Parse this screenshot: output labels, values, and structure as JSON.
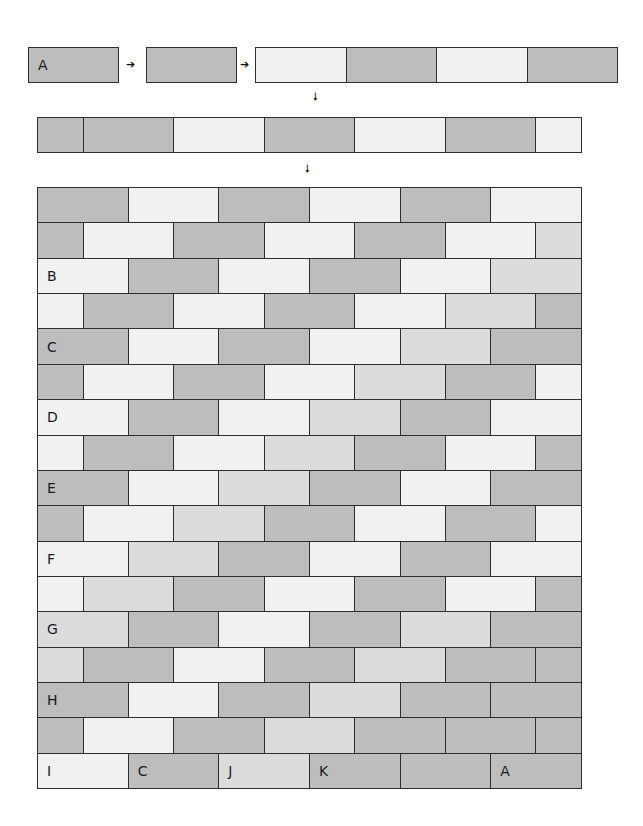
{
  "colors": {
    "D": "#bdbdbd",
    "M": "#dcdcdc",
    "L": "#f1f1f1",
    "border": "#2e2e2e"
  },
  "step1": {
    "box_a": {
      "label": "A",
      "color": "D"
    },
    "box_b": {
      "label": "",
      "color": "D"
    },
    "strip": [
      "L",
      "D",
      "L",
      "D"
    ]
  },
  "arrows": {
    "right": "➔",
    "down": "🠗"
  },
  "step2": {
    "cells": [
      {
        "w": 0.5,
        "c": "D"
      },
      {
        "w": 1,
        "c": "D"
      },
      {
        "w": 1,
        "c": "L"
      },
      {
        "w": 1,
        "c": "D"
      },
      {
        "w": 1,
        "c": "L"
      },
      {
        "w": 1,
        "c": "D"
      },
      {
        "w": 0.5,
        "c": "L"
      }
    ]
  },
  "wall": {
    "rows": [
      {
        "offset": false,
        "cells": [
          {
            "c": "D",
            "label": ""
          },
          {
            "c": "L",
            "label": ""
          },
          {
            "c": "D",
            "label": ""
          },
          {
            "c": "L",
            "label": ""
          },
          {
            "c": "D",
            "label": ""
          },
          {
            "c": "L",
            "label": ""
          }
        ]
      },
      {
        "offset": true,
        "cells": [
          {
            "c": "D",
            "label": ""
          },
          {
            "c": "L",
            "label": ""
          },
          {
            "c": "D",
            "label": ""
          },
          {
            "c": "L",
            "label": ""
          },
          {
            "c": "D",
            "label": ""
          },
          {
            "c": "L",
            "label": ""
          },
          {
            "c": "M",
            "label": ""
          }
        ]
      },
      {
        "offset": false,
        "cells": [
          {
            "c": "L",
            "label": "B"
          },
          {
            "c": "D",
            "label": ""
          },
          {
            "c": "L",
            "label": ""
          },
          {
            "c": "D",
            "label": ""
          },
          {
            "c": "L",
            "label": ""
          },
          {
            "c": "M",
            "label": ""
          }
        ]
      },
      {
        "offset": true,
        "cells": [
          {
            "c": "L",
            "label": ""
          },
          {
            "c": "D",
            "label": ""
          },
          {
            "c": "L",
            "label": ""
          },
          {
            "c": "D",
            "label": ""
          },
          {
            "c": "L",
            "label": ""
          },
          {
            "c": "M",
            "label": ""
          },
          {
            "c": "D",
            "label": ""
          }
        ]
      },
      {
        "offset": false,
        "cells": [
          {
            "c": "D",
            "label": "C"
          },
          {
            "c": "L",
            "label": ""
          },
          {
            "c": "D",
            "label": ""
          },
          {
            "c": "L",
            "label": ""
          },
          {
            "c": "M",
            "label": ""
          },
          {
            "c": "D",
            "label": ""
          }
        ]
      },
      {
        "offset": true,
        "cells": [
          {
            "c": "D",
            "label": ""
          },
          {
            "c": "L",
            "label": ""
          },
          {
            "c": "D",
            "label": ""
          },
          {
            "c": "L",
            "label": ""
          },
          {
            "c": "M",
            "label": ""
          },
          {
            "c": "D",
            "label": ""
          },
          {
            "c": "L",
            "label": ""
          }
        ]
      },
      {
        "offset": false,
        "cells": [
          {
            "c": "L",
            "label": "D"
          },
          {
            "c": "D",
            "label": ""
          },
          {
            "c": "L",
            "label": ""
          },
          {
            "c": "M",
            "label": ""
          },
          {
            "c": "D",
            "label": ""
          },
          {
            "c": "L",
            "label": ""
          }
        ]
      },
      {
        "offset": true,
        "cells": [
          {
            "c": "L",
            "label": ""
          },
          {
            "c": "D",
            "label": ""
          },
          {
            "c": "L",
            "label": ""
          },
          {
            "c": "M",
            "label": ""
          },
          {
            "c": "D",
            "label": ""
          },
          {
            "c": "L",
            "label": ""
          },
          {
            "c": "D",
            "label": ""
          }
        ]
      },
      {
        "offset": false,
        "cells": [
          {
            "c": "D",
            "label": "E"
          },
          {
            "c": "L",
            "label": ""
          },
          {
            "c": "M",
            "label": ""
          },
          {
            "c": "D",
            "label": ""
          },
          {
            "c": "L",
            "label": ""
          },
          {
            "c": "D",
            "label": ""
          }
        ]
      },
      {
        "offset": true,
        "cells": [
          {
            "c": "D",
            "label": ""
          },
          {
            "c": "L",
            "label": ""
          },
          {
            "c": "M",
            "label": ""
          },
          {
            "c": "D",
            "label": ""
          },
          {
            "c": "L",
            "label": ""
          },
          {
            "c": "D",
            "label": ""
          },
          {
            "c": "L",
            "label": ""
          }
        ]
      },
      {
        "offset": false,
        "cells": [
          {
            "c": "L",
            "label": "F"
          },
          {
            "c": "M",
            "label": ""
          },
          {
            "c": "D",
            "label": ""
          },
          {
            "c": "L",
            "label": ""
          },
          {
            "c": "D",
            "label": ""
          },
          {
            "c": "L",
            "label": ""
          }
        ]
      },
      {
        "offset": true,
        "cells": [
          {
            "c": "L",
            "label": ""
          },
          {
            "c": "M",
            "label": ""
          },
          {
            "c": "D",
            "label": ""
          },
          {
            "c": "L",
            "label": ""
          },
          {
            "c": "D",
            "label": ""
          },
          {
            "c": "L",
            "label": ""
          },
          {
            "c": "D",
            "label": ""
          }
        ]
      },
      {
        "offset": false,
        "cells": [
          {
            "c": "M",
            "label": "G"
          },
          {
            "c": "D",
            "label": ""
          },
          {
            "c": "L",
            "label": ""
          },
          {
            "c": "D",
            "label": ""
          },
          {
            "c": "M",
            "label": ""
          },
          {
            "c": "D",
            "label": ""
          }
        ]
      },
      {
        "offset": true,
        "cells": [
          {
            "c": "M",
            "label": ""
          },
          {
            "c": "D",
            "label": ""
          },
          {
            "c": "L",
            "label": ""
          },
          {
            "c": "D",
            "label": ""
          },
          {
            "c": "M",
            "label": ""
          },
          {
            "c": "D",
            "label": ""
          },
          {
            "c": "D",
            "label": ""
          }
        ]
      },
      {
        "offset": false,
        "cells": [
          {
            "c": "D",
            "label": "H"
          },
          {
            "c": "L",
            "label": ""
          },
          {
            "c": "D",
            "label": ""
          },
          {
            "c": "M",
            "label": ""
          },
          {
            "c": "D",
            "label": ""
          },
          {
            "c": "D",
            "label": ""
          }
        ]
      },
      {
        "offset": true,
        "cells": [
          {
            "c": "D",
            "label": ""
          },
          {
            "c": "L",
            "label": ""
          },
          {
            "c": "D",
            "label": ""
          },
          {
            "c": "M",
            "label": ""
          },
          {
            "c": "D",
            "label": ""
          },
          {
            "c": "D",
            "label": ""
          },
          {
            "c": "D",
            "label": ""
          }
        ]
      },
      {
        "offset": false,
        "cells": [
          {
            "c": "L",
            "label": "I"
          },
          {
            "c": "D",
            "label": "C"
          },
          {
            "c": "M",
            "label": "J"
          },
          {
            "c": "D",
            "label": "K"
          },
          {
            "c": "D",
            "label": ""
          },
          {
            "c": "D",
            "label": "A"
          }
        ]
      }
    ]
  }
}
